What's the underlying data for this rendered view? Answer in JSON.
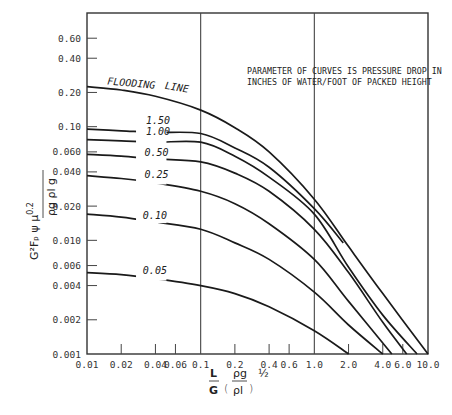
{
  "chart_data": {
    "type": "line",
    "title": "",
    "annotation": [
      "PARAMETER OF CURVES IS PRESSURE DROP IN",
      "INCHES OF WATER/FOOT OF PACKED HEIGHT"
    ],
    "xlabel": "L/G (ρg/ρl)^½",
    "ylabel": "G²Fp ψ μ^0.2 / (ρg ρl g)",
    "xscale": "log",
    "yscale": "log",
    "xlim": [
      0.01,
      10.0
    ],
    "ylim": [
      0.001,
      1.0
    ],
    "x_ticks": [
      "0.01",
      "0.02",
      "0.04",
      "0.06",
      "0.1",
      "0.2",
      "0.4",
      "0.6",
      "1.0",
      "2.0",
      "4.0",
      "6.0",
      "10.0"
    ],
    "x_tick_values": [
      0.01,
      0.02,
      0.04,
      0.06,
      0.1,
      0.2,
      0.4,
      0.6,
      1.0,
      2.0,
      4.0,
      6.0,
      10.0
    ],
    "y_ticks": [
      "0.60",
      "0.40",
      "0.20",
      "0.10",
      "0.060",
      "0.040",
      "0.020",
      "0.010",
      "0.006",
      "0.004",
      "0.002",
      "0.001"
    ],
    "y_tick_values": [
      0.6,
      0.4,
      0.2,
      0.1,
      0.06,
      0.04,
      0.02,
      0.01,
      0.006,
      0.004,
      0.002,
      0.001
    ],
    "gridlines_x": [
      0.1,
      1.0
    ],
    "legend": "none",
    "series": [
      {
        "name": "FLOODING LINE",
        "x": [
          0.01,
          0.02,
          0.04,
          0.1,
          0.2,
          0.4,
          1.0,
          2.0,
          4.0,
          10.0
        ],
        "values": [
          0.225,
          0.21,
          0.185,
          0.14,
          0.098,
          0.06,
          0.023,
          0.0088,
          0.0034,
          0.001
        ]
      },
      {
        "name": "1.50",
        "x": [
          0.01,
          0.02,
          0.04,
          0.1,
          0.2,
          0.4,
          1.0,
          1.8
        ],
        "values": [
          0.095,
          0.092,
          0.089,
          0.087,
          0.065,
          0.044,
          0.019,
          0.0095
        ]
      },
      {
        "name": "1.00",
        "x": [
          0.01,
          0.02,
          0.04,
          0.1,
          0.2,
          0.4,
          1.0,
          2.0,
          4.0,
          8.0
        ],
        "values": [
          0.077,
          0.075,
          0.073,
          0.073,
          0.055,
          0.036,
          0.017,
          0.0058,
          0.0022,
          0.001
        ]
      },
      {
        "name": "0.50",
        "x": [
          0.01,
          0.02,
          0.04,
          0.1,
          0.2,
          0.4,
          1.0,
          2.0,
          4.0,
          6.5
        ],
        "values": [
          0.057,
          0.055,
          0.052,
          0.049,
          0.039,
          0.027,
          0.0125,
          0.0052,
          0.0019,
          0.001
        ]
      },
      {
        "name": "0.25",
        "x": [
          0.01,
          0.02,
          0.04,
          0.1,
          0.2,
          0.4,
          1.0,
          2.0,
          4.8
        ],
        "values": [
          0.037,
          0.035,
          0.032,
          0.027,
          0.021,
          0.014,
          0.0068,
          0.0029,
          0.001
        ]
      },
      {
        "name": "0.10",
        "x": [
          0.01,
          0.02,
          0.04,
          0.1,
          0.2,
          0.4,
          1.0,
          2.0,
          4.0
        ],
        "values": [
          0.017,
          0.016,
          0.0145,
          0.0125,
          0.0095,
          0.0068,
          0.0035,
          0.0018,
          0.001
        ]
      },
      {
        "name": "0.05",
        "x": [
          0.01,
          0.02,
          0.04,
          0.1,
          0.2,
          0.4,
          1.0,
          2.0
        ],
        "values": [
          0.0052,
          0.005,
          0.0046,
          0.004,
          0.0034,
          0.0026,
          0.0016,
          0.001
        ]
      }
    ],
    "curve_labels": [
      {
        "series": "FLOODING LINE",
        "text": "FLOODING",
        "x": 0.015,
        "y": 0.235
      },
      {
        "series": "FLOODING LINE",
        "text": "LINE",
        "x": 0.048,
        "y": 0.215
      },
      {
        "series": "1.50",
        "text": "1.50",
        "x": 0.033,
        "y": 0.114
      },
      {
        "series": "1.00",
        "text": "1.00",
        "x": 0.033,
        "y": 0.092
      },
      {
        "series": "0.50",
        "text": "0.50",
        "x": 0.032,
        "y": 0.06
      },
      {
        "series": "0.25",
        "text": "0.25",
        "x": 0.032,
        "y": 0.038
      },
      {
        "series": "0.10",
        "text": "0.10",
        "x": 0.031,
        "y": 0.0168
      },
      {
        "series": "0.05",
        "text": "0.05",
        "x": 0.031,
        "y": 0.0055
      }
    ]
  },
  "labels": {
    "y_numerator": "G²Fₚ ψ μ",
    "y_exponent": "0.2",
    "y_denominator": "ρg ρl g",
    "x_frac_num": "L",
    "x_frac_den": "G",
    "x_rho_num": "ρg",
    "x_rho_den": "ρl",
    "x_power": "½"
  }
}
